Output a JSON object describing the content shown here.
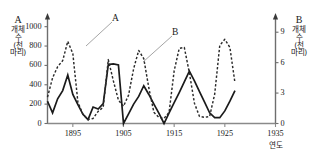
{
  "axes": {
    "left": {
      "series_letter": "A",
      "unit_lines": [
        "개체",
        "수",
        "(천",
        "마리)"
      ],
      "ticks": [
        "0",
        "200",
        "400",
        "600",
        "800",
        "1000"
      ],
      "min": 0,
      "max": 1100
    },
    "right": {
      "series_letter": "B",
      "unit_lines": [
        "개체",
        "수",
        "(천",
        "마리)"
      ],
      "ticks": [
        "0",
        "3",
        "6",
        "9"
      ],
      "min": 0,
      "max": 10.5
    },
    "x": {
      "title": "연도",
      "ticks": [
        "1895",
        "1905",
        "1915",
        "1925",
        "1935"
      ],
      "min": 1890,
      "max": 1935
    }
  },
  "labels": {
    "series_a": "A",
    "series_b": "B"
  },
  "chart_data": {
    "type": "line",
    "title": "",
    "xlabel": "연도",
    "ylabel": "A 개체 수 (천 마리)",
    "y2label": "B 개체 수 (천 마리)",
    "xlim": [
      1890,
      1935
    ],
    "ylim": [
      0,
      1100
    ],
    "y2lim": [
      0,
      10.5
    ],
    "grid": false,
    "legend": "inline-annotations",
    "series": [
      {
        "name": "A",
        "axis": "left",
        "style": "solid",
        "color": "#1a1a1a",
        "unit": "천 마리",
        "points": [
          [
            1890,
            230
          ],
          [
            1891,
            110
          ],
          [
            1892,
            255
          ],
          [
            1893,
            340
          ],
          [
            1894,
            500
          ],
          [
            1895,
            300
          ],
          [
            1896,
            195
          ],
          [
            1897,
            95
          ],
          [
            1898,
            40
          ],
          [
            1899,
            170
          ],
          [
            1900,
            150
          ],
          [
            1901,
            205
          ],
          [
            1902,
            610
          ],
          [
            1903,
            615
          ],
          [
            1904,
            605
          ],
          [
            1905,
            0
          ],
          [
            1906,
            100
          ],
          [
            1907,
            200
          ],
          [
            1908,
            280
          ],
          [
            1909,
            390
          ],
          [
            1910,
            300
          ],
          [
            1911,
            200
          ],
          [
            1912,
            105
          ],
          [
            1913,
            0
          ],
          [
            1914,
            110
          ],
          [
            1915,
            215
          ],
          [
            1916,
            320
          ],
          [
            1917,
            430
          ],
          [
            1918,
            540
          ],
          [
            1919,
            440
          ],
          [
            1920,
            330
          ],
          [
            1921,
            220
          ],
          [
            1922,
            110
          ],
          [
            1923,
            60
          ],
          [
            1924,
            60
          ],
          [
            1925,
            130
          ],
          [
            1926,
            230
          ],
          [
            1927,
            340
          ]
        ]
      },
      {
        "name": "B",
        "axis": "right",
        "style": "dashed",
        "color": "#1a1a1a",
        "unit": "천 마리",
        "points": [
          [
            1890,
            2.6
          ],
          [
            1891,
            4.5
          ],
          [
            1892,
            5.6
          ],
          [
            1893,
            6.2
          ],
          [
            1894,
            8.1
          ],
          [
            1895,
            6.9
          ],
          [
            1896,
            2.1
          ],
          [
            1897,
            0.9
          ],
          [
            1898,
            0.4
          ],
          [
            1899,
            0.5
          ],
          [
            1900,
            1.2
          ],
          [
            1901,
            1.6
          ],
          [
            1902,
            6.3
          ],
          [
            1903,
            4.2
          ],
          [
            1904,
            2.3
          ],
          [
            1905,
            1.7
          ],
          [
            1906,
            2.8
          ],
          [
            1907,
            5.4
          ],
          [
            1908,
            7.2
          ],
          [
            1909,
            6.4
          ],
          [
            1910,
            3.5
          ],
          [
            1911,
            1.1
          ],
          [
            1912,
            0.6
          ],
          [
            1913,
            0.5
          ],
          [
            1914,
            1.1
          ],
          [
            1915,
            5.2
          ],
          [
            1916,
            7.4
          ],
          [
            1917,
            7.5
          ],
          [
            1918,
            5.0
          ],
          [
            1919,
            2.0
          ],
          [
            1920,
            0.7
          ],
          [
            1921,
            0.6
          ],
          [
            1922,
            0.7
          ],
          [
            1923,
            2.9
          ],
          [
            1924,
            7.7
          ],
          [
            1925,
            8.3
          ],
          [
            1926,
            7.5
          ],
          [
            1927,
            4.0
          ]
        ]
      }
    ],
    "annotations": [
      {
        "text": "A",
        "series": "A",
        "note": "leader line to solid curve first peak"
      },
      {
        "text": "B",
        "series": "B",
        "note": "leader line to dashed curve"
      }
    ]
  }
}
